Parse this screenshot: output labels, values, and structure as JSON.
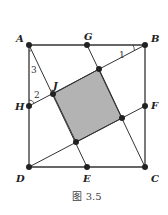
{
  "figure": {
    "caption": "图 3.5",
    "colors": {
      "line": "#333333",
      "point": "#222222",
      "fill": "#b3b3b3",
      "background": "#ffffff"
    },
    "points": {
      "A": {
        "label": "A",
        "x": 29,
        "y": 45
      },
      "G": {
        "label": "G",
        "x": 87,
        "y": 45
      },
      "B": {
        "label": "B",
        "x": 145,
        "y": 45
      },
      "F": {
        "label": "F",
        "x": 145,
        "y": 106
      },
      "C": {
        "label": "C",
        "x": 145,
        "y": 167
      },
      "E": {
        "label": "E",
        "x": 87,
        "y": 167
      },
      "D": {
        "label": "D",
        "x": 29,
        "y": 167
      },
      "H": {
        "label": "H",
        "x": 29,
        "y": 106
      },
      "J": {
        "label": "J",
        "x": 53,
        "y": 94
      },
      "P_top": {
        "x": 99,
        "y": 69
      },
      "P_right": {
        "x": 122,
        "y": 118
      },
      "P_bottom": {
        "x": 76,
        "y": 142
      }
    },
    "angle_labels": [
      {
        "text": "1",
        "x": 121,
        "y": 57
      },
      {
        "text": "2",
        "x": 34,
        "y": 97
      },
      {
        "text": "3",
        "x": 33,
        "y": 72
      }
    ],
    "segments": [
      [
        "A",
        "B"
      ],
      [
        "B",
        "C"
      ],
      [
        "C",
        "D"
      ],
      [
        "D",
        "A"
      ],
      [
        "A",
        "P_bottom_ext"
      ],
      [
        "B",
        "H"
      ],
      [
        "C",
        "G"
      ],
      [
        "D",
        "F"
      ],
      [
        "G",
        "P_top"
      ],
      [
        "E",
        "P_bottom"
      ]
    ],
    "shaded_region": [
      "J",
      "P_top",
      "P_right",
      "P_bottom"
    ]
  }
}
